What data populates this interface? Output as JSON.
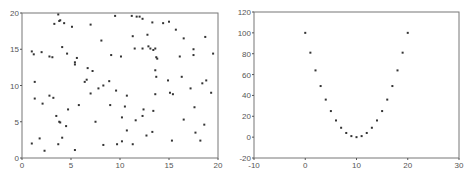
{
  "chart_data": [
    {
      "type": "scatter",
      "title": "",
      "xlabel": "",
      "ylabel": "",
      "xlim": [
        0,
        20
      ],
      "ylim": [
        0,
        20
      ],
      "xticks": [
        "0",
        "5",
        "10",
        "15",
        "20"
      ],
      "yticks": [
        "0",
        "5",
        "10",
        "15",
        "20"
      ],
      "grid": false,
      "legend": null,
      "marker_color": "#333333",
      "points": [
        [
          3.7,
          19.8
        ],
        [
          3.3,
          18.5
        ],
        [
          3.8,
          18.9
        ],
        [
          3.9,
          19.0
        ],
        [
          4.3,
          18.6
        ],
        [
          5.1,
          18.1
        ],
        [
          7.0,
          18.4
        ],
        [
          9.5,
          19.6
        ],
        [
          11.2,
          19.6
        ],
        [
          11.7,
          19.5
        ],
        [
          12.0,
          19.5
        ],
        [
          12.3,
          19.2
        ],
        [
          13.3,
          18.7
        ],
        [
          14.4,
          18.6
        ],
        [
          15.0,
          18.8
        ],
        [
          15.7,
          17.7
        ],
        [
          11.3,
          16.8
        ],
        [
          12.8,
          17.0
        ],
        [
          8.1,
          16.2
        ],
        [
          16.5,
          16.5
        ],
        [
          18.7,
          16.7
        ],
        [
          1.0,
          14.7
        ],
        [
          1.2,
          14.3
        ],
        [
          2.0,
          14.6
        ],
        [
          2.8,
          14.0
        ],
        [
          3.1,
          13.9
        ],
        [
          4.1,
          15.3
        ],
        [
          4.6,
          14.4
        ],
        [
          5.6,
          13.8
        ],
        [
          5.4,
          13.2
        ],
        [
          5.4,
          12.9
        ],
        [
          6.7,
          12.4
        ],
        [
          7.2,
          12.0
        ],
        [
          6.4,
          10.5
        ],
        [
          6.6,
          10.8
        ],
        [
          9.1,
          14.2
        ],
        [
          10.1,
          14.0
        ],
        [
          11.5,
          15.1
        ],
        [
          12.3,
          15.1
        ],
        [
          12.9,
          15.4
        ],
        [
          13.1,
          15.1
        ],
        [
          13.4,
          14.9
        ],
        [
          13.6,
          15.1
        ],
        [
          13.7,
          13.9
        ],
        [
          13.8,
          13.7
        ],
        [
          13.6,
          12.1
        ],
        [
          13.7,
          11.2
        ],
        [
          16.1,
          14.0
        ],
        [
          17.5,
          15.0
        ],
        [
          17.5,
          14.2
        ],
        [
          19.5,
          14.4
        ],
        [
          16.3,
          11.2
        ],
        [
          14.9,
          10.7
        ],
        [
          18.8,
          10.7
        ],
        [
          18.4,
          10.3
        ],
        [
          17.2,
          9.6
        ],
        [
          1.3,
          10.5
        ],
        [
          1.3,
          8.2
        ],
        [
          2.1,
          7.5
        ],
        [
          2.8,
          8.6
        ],
        [
          3.2,
          8.3
        ],
        [
          4.7,
          6.7
        ],
        [
          5.8,
          7.3
        ],
        [
          7.0,
          8.9
        ],
        [
          7.8,
          9.6
        ],
        [
          8.3,
          10.0
        ],
        [
          8.9,
          10.6
        ],
        [
          9.6,
          9.3
        ],
        [
          9.0,
          7.3
        ],
        [
          10.7,
          8.6
        ],
        [
          10.5,
          7.1
        ],
        [
          10.2,
          5.6
        ],
        [
          12.4,
          6.7
        ],
        [
          12.3,
          5.8
        ],
        [
          11.6,
          5.2
        ],
        [
          13.4,
          6.5
        ],
        [
          13.6,
          8.8
        ],
        [
          15.1,
          9.0
        ],
        [
          15.4,
          8.8
        ],
        [
          17.6,
          7.0
        ],
        [
          19.3,
          9.0
        ],
        [
          3.5,
          5.8
        ],
        [
          3.8,
          5.0
        ],
        [
          3.9,
          4.9
        ],
        [
          4.5,
          4.4
        ],
        [
          7.5,
          5.0
        ],
        [
          10.7,
          3.8
        ],
        [
          16.5,
          5.3
        ],
        [
          18.6,
          4.6
        ],
        [
          17.7,
          3.5
        ],
        [
          13.3,
          3.6
        ],
        [
          12.7,
          3.1
        ],
        [
          1.0,
          2.0
        ],
        [
          1.8,
          2.7
        ],
        [
          2.3,
          1.0
        ],
        [
          3.7,
          1.9
        ],
        [
          4.1,
          2.8
        ],
        [
          5.4,
          1.1
        ],
        [
          8.3,
          1.8
        ],
        [
          9.7,
          1.9
        ],
        [
          10.2,
          2.3
        ],
        [
          11.3,
          1.9
        ],
        [
          15.3,
          2.4
        ],
        [
          18.2,
          2.4
        ]
      ]
    },
    {
      "type": "scatter",
      "title": "",
      "xlabel": "",
      "ylabel": "",
      "xlim": [
        -10,
        30
      ],
      "ylim": [
        -20,
        120
      ],
      "xticks": [
        "-10",
        "0",
        "10",
        "20",
        "30"
      ],
      "yticks": [
        "-20",
        "0",
        "20",
        "40",
        "60",
        "80",
        "100",
        "120"
      ],
      "grid": false,
      "legend": null,
      "marker_color": "#333333",
      "points": [
        [
          0,
          100
        ],
        [
          1,
          81
        ],
        [
          2,
          64
        ],
        [
          3,
          49
        ],
        [
          4,
          36
        ],
        [
          5,
          25
        ],
        [
          6,
          16
        ],
        [
          7,
          9
        ],
        [
          8,
          4
        ],
        [
          9,
          1
        ],
        [
          10,
          0
        ],
        [
          11,
          1
        ],
        [
          12,
          4
        ],
        [
          13,
          9
        ],
        [
          14,
          16
        ],
        [
          15,
          25
        ],
        [
          16,
          36
        ],
        [
          17,
          49
        ],
        [
          18,
          64
        ],
        [
          19,
          81
        ],
        [
          20,
          100
        ]
      ]
    }
  ]
}
